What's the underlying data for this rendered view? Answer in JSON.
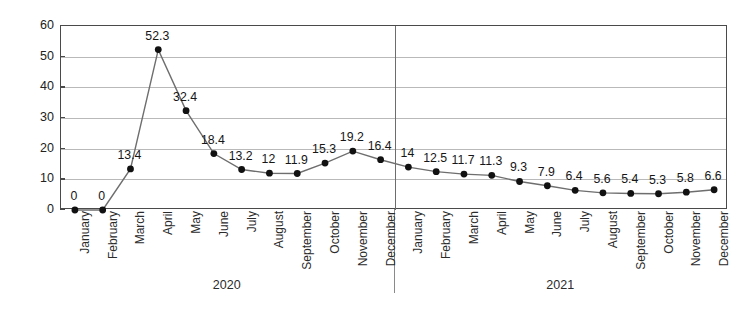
{
  "chart_data": {
    "type": "line",
    "title": "",
    "xlabel": "",
    "ylabel": "Percentage",
    "ylim": [
      0,
      60
    ],
    "ytick_values": [
      0,
      10,
      20,
      30,
      40,
      50,
      60
    ],
    "ytick_labels": [
      "0",
      "10",
      "20",
      "30",
      "40",
      "50",
      "60"
    ],
    "grid": true,
    "legend": "none",
    "marker": "filled-circle",
    "line_color": "#6e6e6e",
    "marker_color": "#111111",
    "grid_color": "#b9b9b9",
    "axis_color": "#4a4a4a",
    "categories": [
      "January",
      "February",
      "March",
      "April",
      "May",
      "June",
      "July",
      "August",
      "September",
      "October",
      "November",
      "December",
      "January",
      "February",
      "March",
      "April",
      "May",
      "June",
      "July",
      "August",
      "September",
      "October",
      "November",
      "December"
    ],
    "values": [
      0,
      0,
      13.4,
      52.3,
      32.4,
      18.4,
      13.2,
      12,
      11.9,
      15.3,
      19.2,
      16.4,
      14,
      12.5,
      11.7,
      11.3,
      9.3,
      7.9,
      6.4,
      5.6,
      5.4,
      5.3,
      5.8,
      6.6
    ],
    "point_labels": [
      "0",
      "0",
      "13.4",
      "52.3",
      "32.4",
      "18.4",
      "13.2",
      "12",
      "11.9",
      "15.3",
      "19.2",
      "16.4",
      "14",
      "12.5",
      "11.7",
      "11.3",
      "9.3",
      "7.9",
      "6.4",
      "5.6",
      "5.4",
      "5.3",
      "5.8",
      "6.6"
    ],
    "groups": [
      {
        "label": "2020",
        "start_index": 0,
        "end_index": 11
      },
      {
        "label": "2021",
        "start_index": 12,
        "end_index": 23
      }
    ],
    "group_divider_after_index": 11
  }
}
